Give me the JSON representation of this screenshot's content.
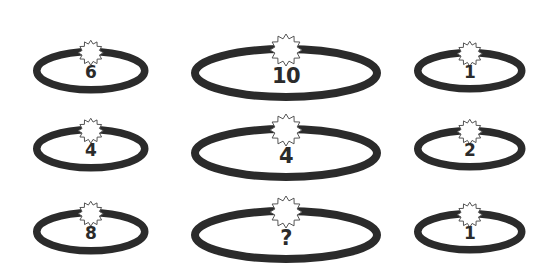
{
  "puzzle": {
    "title": "Ellipse number puzzle",
    "background_color": "#ffffff",
    "ring_color": "#2b2b2b",
    "burst_fill": "#ffffff",
    "burst_stroke": "#555555",
    "text_color": "#2b2b2b",
    "rows": 3,
    "columns": 3,
    "cells": [
      {
        "id": "r1c1",
        "row": 1,
        "col": 1,
        "value": "6",
        "size": "small",
        "x": 30,
        "y": 22,
        "rx": 54,
        "ry": 19
      },
      {
        "id": "r1c2",
        "row": 1,
        "col": 2,
        "value": "10",
        "size": "wide",
        "x": 188,
        "y": 19,
        "rx": 91,
        "ry": 24
      },
      {
        "id": "r1c3",
        "row": 1,
        "col": 3,
        "value": "1",
        "size": "right",
        "x": 411,
        "y": 23,
        "rx": 52,
        "ry": 18
      },
      {
        "id": "r2c1",
        "row": 2,
        "col": 1,
        "value": "4",
        "size": "small",
        "x": 30,
        "y": 100,
        "rx": 54,
        "ry": 19
      },
      {
        "id": "r2c2",
        "row": 2,
        "col": 2,
        "value": "4",
        "size": "wide",
        "x": 188,
        "y": 99,
        "rx": 91,
        "ry": 24
      },
      {
        "id": "r2c3",
        "row": 2,
        "col": 3,
        "value": "2",
        "size": "right",
        "x": 411,
        "y": 101,
        "rx": 52,
        "ry": 18
      },
      {
        "id": "r3c1",
        "row": 3,
        "col": 1,
        "value": "8",
        "size": "small",
        "x": 30,
        "y": 183,
        "rx": 54,
        "ry": 19
      },
      {
        "id": "r3c2",
        "row": 3,
        "col": 2,
        "value": "?",
        "size": "wide",
        "x": 188,
        "y": 181,
        "rx": 91,
        "ry": 24
      },
      {
        "id": "r3c3",
        "row": 3,
        "col": 3,
        "value": "1",
        "size": "right",
        "x": 411,
        "y": 184,
        "rx": 52,
        "ry": 18
      }
    ]
  }
}
